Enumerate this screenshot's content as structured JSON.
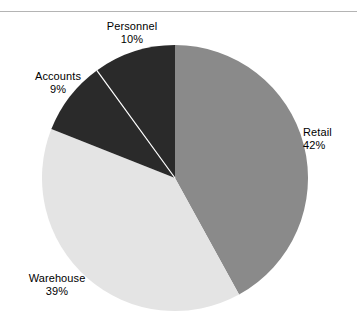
{
  "figure": {
    "background_color": "#ffffff",
    "rule_color": "#b4b4b4",
    "label_text_color": "#000000"
  },
  "chart_data": {
    "type": "pie",
    "title": "",
    "subtitle": "",
    "xlabel": "",
    "ylabel": "",
    "legend_position": "none",
    "grid": false,
    "value_unit": "percent",
    "start_angle_deg": 0,
    "direction": "clockwise",
    "center": {
      "x": 175,
      "y": 178
    },
    "radius": 133,
    "categories": [
      "Retail",
      "Warehouse",
      "Accounts",
      "Personnel"
    ],
    "values": [
      42,
      39,
      9,
      10
    ],
    "colors": [
      "#8a8a8a",
      "#e4e4e4",
      "#2a2a2a",
      "#2a2a2a"
    ],
    "slice_divider_color": "#ffffff",
    "slices": [
      {
        "name": "Retail",
        "value": 42,
        "label": "Retail",
        "value_label": "42%",
        "color": "#8a8a8a",
        "start_deg": 0,
        "end_deg": 151.2
      },
      {
        "name": "Warehouse",
        "value": 39,
        "label": "Warehouse",
        "value_label": "39%",
        "color": "#e4e4e4",
        "start_deg": 151.2,
        "end_deg": 291.6
      },
      {
        "name": "Accounts",
        "value": 9,
        "label": "Accounts",
        "value_label": "9%",
        "color": "#2a2a2a",
        "start_deg": 291.6,
        "end_deg": 324.0
      },
      {
        "name": "Personnel",
        "value": 10,
        "label": "Personnel",
        "value_label": "10%",
        "color": "#2a2a2a",
        "start_deg": 324.0,
        "end_deg": 360.0
      }
    ]
  }
}
